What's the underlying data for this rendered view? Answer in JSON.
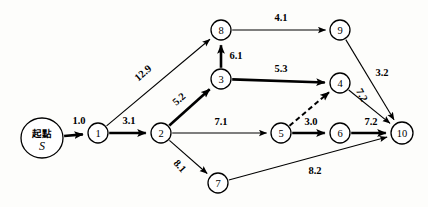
{
  "diagram": {
    "type": "directed-weighted-graph",
    "colors": {
      "stroke": "#000000",
      "node_fill": "#ffffff",
      "background": "#fdfdfb"
    },
    "start_node": {
      "id": "S",
      "label_cn": "起點",
      "label_symbol": "S",
      "x": 42,
      "y": 138,
      "rx": 21,
      "ry": 20
    },
    "nodes": [
      {
        "id": "1",
        "label": "1",
        "x": 98,
        "y": 133,
        "r": 10
      },
      {
        "id": "2",
        "label": "2",
        "x": 161,
        "y": 133,
        "r": 10
      },
      {
        "id": "3",
        "label": "3",
        "x": 221,
        "y": 79,
        "r": 10
      },
      {
        "id": "4",
        "label": "4",
        "x": 340,
        "y": 83,
        "r": 10
      },
      {
        "id": "5",
        "label": "5",
        "x": 281,
        "y": 133,
        "r": 10
      },
      {
        "id": "6",
        "label": "6",
        "x": 340,
        "y": 133,
        "r": 10
      },
      {
        "id": "7",
        "label": "7",
        "x": 218,
        "y": 183,
        "r": 10
      },
      {
        "id": "8",
        "label": "8",
        "x": 221,
        "y": 30,
        "r": 10
      },
      {
        "id": "9",
        "label": "9",
        "x": 340,
        "y": 30,
        "r": 10
      },
      {
        "id": "10",
        "label": "10",
        "x": 402,
        "y": 133,
        "r": 11
      }
    ],
    "edges": [
      {
        "from": "S",
        "to": "1",
        "weight": "1.0",
        "style": "bold",
        "label_x": 79,
        "label_y": 120,
        "rotate": 0
      },
      {
        "from": "1",
        "to": "2",
        "weight": "3.1",
        "style": "bold",
        "label_x": 129,
        "label_y": 120,
        "rotate": 0
      },
      {
        "from": "1",
        "to": "8",
        "weight": "12.9",
        "style": "thin",
        "label_x": 143,
        "label_y": 73,
        "rotate": -41
      },
      {
        "from": "2",
        "to": "3",
        "weight": "5.2",
        "style": "bold",
        "label_x": 179,
        "label_y": 99,
        "rotate": -41
      },
      {
        "from": "2",
        "to": "5",
        "weight": "7.1",
        "style": "thin",
        "label_x": 221,
        "label_y": 121,
        "rotate": 0
      },
      {
        "from": "2",
        "to": "7",
        "weight": "8.1",
        "style": "thin",
        "label_x": 180,
        "label_y": 166,
        "rotate": 48
      },
      {
        "from": "3",
        "to": "8",
        "weight": "6.1",
        "style": "bold",
        "label_x": 236,
        "label_y": 55,
        "rotate": 0
      },
      {
        "from": "3",
        "to": "4",
        "weight": "5.3",
        "style": "bold",
        "label_x": 281,
        "label_y": 68,
        "rotate": 0
      },
      {
        "from": "8",
        "to": "9",
        "weight": "4.1",
        "style": "thin",
        "label_x": 281,
        "label_y": 17,
        "rotate": 0
      },
      {
        "from": "9",
        "to": "10",
        "weight": "3.2",
        "style": "thin",
        "label_x": 382,
        "label_y": 72,
        "rotate": 0
      },
      {
        "from": "4",
        "to": "10",
        "weight": "7.2",
        "style": "thin",
        "label_x": 362,
        "label_y": 95,
        "rotate": 62
      },
      {
        "from": "5",
        "to": "4",
        "weight": "",
        "style": "dashed",
        "label_x": 0,
        "label_y": 0,
        "rotate": 0
      },
      {
        "from": "5",
        "to": "6",
        "weight": "3.0",
        "style": "bold",
        "label_x": 311,
        "label_y": 121,
        "rotate": 0
      },
      {
        "from": "6",
        "to": "10",
        "weight": "7.2",
        "style": "bold",
        "label_x": 371,
        "label_y": 121,
        "rotate": 0
      },
      {
        "from": "7",
        "to": "10",
        "weight": "8.2",
        "style": "thin",
        "label_x": 315,
        "label_y": 170,
        "rotate": 0
      }
    ]
  }
}
